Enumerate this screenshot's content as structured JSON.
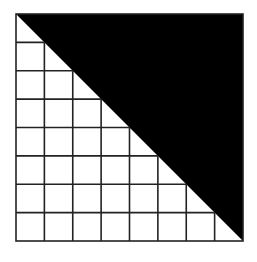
{
  "diagram": {
    "type": "grid-with-shaded-triangle",
    "grid": {
      "rows": 8,
      "cols": 8
    },
    "square": {
      "x": 16,
      "y": 14,
      "size": 227
    },
    "shaded_region": "upper-right triangle above diagonal from top-left to bottom-right",
    "colors": {
      "shade": "#000000",
      "line": "#222222",
      "background": "#ffffff"
    }
  }
}
